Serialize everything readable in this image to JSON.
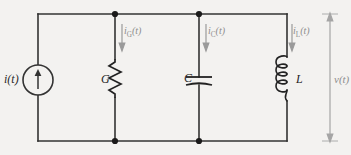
{
  "figure": {
    "background_color": "#f3f2f0",
    "wire_color": "#333333",
    "faint_color": "#9a9a9a"
  },
  "source": {
    "type": "current-source",
    "label": "i(t)",
    "arrow_direction": "up"
  },
  "components": [
    {
      "id": "G",
      "type": "resistor",
      "label": "G",
      "branch_current": "i",
      "branch_current_sub": "G"
    },
    {
      "id": "C",
      "type": "capacitor",
      "label": "C",
      "branch_current": "i",
      "branch_current_sub": "C"
    },
    {
      "id": "L",
      "type": "inductor",
      "label": "L",
      "branch_current": "i",
      "branch_current_sub": "L"
    }
  ],
  "currents": {
    "g": {
      "symbol": "i",
      "subscript": "G",
      "arg": "(t)",
      "direction": "down"
    },
    "c": {
      "symbol": "i",
      "subscript": "C",
      "arg": "(t)",
      "direction": "down"
    },
    "l": {
      "symbol": "i",
      "subscript": "L",
      "arg": "(t)",
      "direction": "down"
    }
  },
  "voltage": {
    "label": "v(t)",
    "arrow_style": "double-headed",
    "position": "right"
  }
}
